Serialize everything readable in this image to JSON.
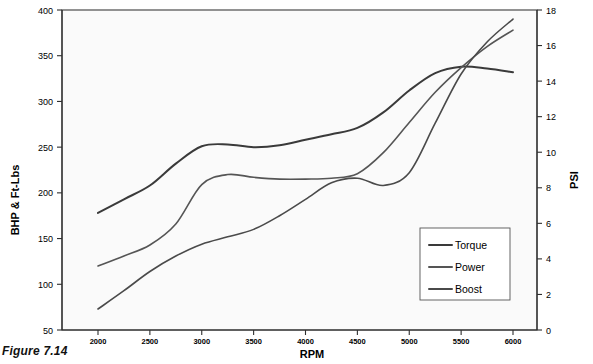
{
  "figure": {
    "caption": "Figure 7.14"
  },
  "chart_data": {
    "type": "line",
    "title": "",
    "xlabel": "RPM",
    "ylabel": "BHP & Ft-Lbs",
    "y2label": "PSI",
    "xlim": [
      2000,
      6000
    ],
    "ylim": [
      50,
      400
    ],
    "y2lim": [
      0,
      18
    ],
    "grid": false,
    "legend_position": "inside-bottom-right",
    "x_ticks": [
      2000,
      2500,
      3000,
      3500,
      4000,
      4500,
      5000,
      5500,
      6000
    ],
    "y_ticks": [
      50,
      100,
      150,
      200,
      250,
      300,
      350,
      400
    ],
    "y2_ticks": [
      0,
      2,
      4,
      6,
      8,
      10,
      12,
      14,
      16,
      18
    ],
    "x": [
      2000,
      2250,
      2500,
      2750,
      3000,
      3250,
      3500,
      3750,
      4000,
      4250,
      4500,
      4750,
      5000,
      5250,
      5500,
      5750,
      6000
    ],
    "series": [
      {
        "name": "Torque",
        "axis": "left",
        "color": "#3a3a3a",
        "width": 2.0,
        "values": [
          178,
          193,
          208,
          232,
          251,
          253,
          250,
          252,
          258,
          264,
          271,
          288,
          312,
          331,
          338,
          336,
          332
        ]
      },
      {
        "name": "Power",
        "axis": "left",
        "color": "#555555",
        "width": 1.6,
        "values": [
          120,
          131,
          143,
          166,
          209,
          220,
          217,
          215,
          215,
          216,
          221,
          244,
          277,
          310,
          337,
          360,
          378
        ]
      },
      {
        "name": "Boost",
        "axis": "right",
        "color": "#4a4a4a",
        "width": 1.6,
        "values_left_scale": [
          73,
          93,
          114,
          131,
          144,
          152,
          160,
          175,
          193,
          211,
          216,
          208,
          222,
          276,
          330,
          365,
          390
        ],
        "values": [
          1.18,
          2.21,
          3.29,
          4.16,
          4.83,
          5.24,
          5.66,
          6.43,
          7.35,
          8.28,
          8.54,
          8.13,
          8.85,
          11.63,
          14.4,
          16.2,
          17.49
        ]
      }
    ],
    "legend": [
      {
        "label": "Torque",
        "color": "#3a3a3a"
      },
      {
        "label": "Power",
        "color": "#555555"
      },
      {
        "label": "Boost",
        "color": "#4a4a4a"
      }
    ]
  }
}
